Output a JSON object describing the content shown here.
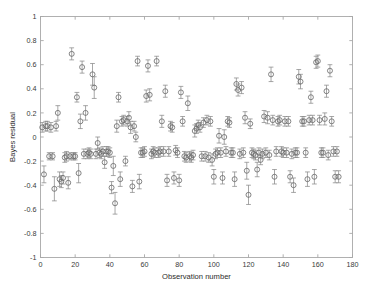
{
  "chart_data": {
    "type": "scatter",
    "title": "",
    "xlabel": "Observation number",
    "ylabel": "Bayes residual",
    "xlim": [
      0,
      180
    ],
    "ylim": [
      -1,
      1
    ],
    "xticks": [
      0,
      20,
      40,
      60,
      80,
      100,
      120,
      140,
      160,
      180
    ],
    "xticklabels": [
      "0",
      "20",
      "40",
      "60",
      "80",
      "100",
      "120",
      "140",
      "160",
      "180"
    ],
    "yticks": [
      -1,
      -0.8,
      -0.6,
      -0.4,
      -0.2,
      0,
      0.2,
      0.4,
      0.6,
      0.8,
      1
    ],
    "yticklabels": [
      "-1",
      "-0.8",
      "-0.6",
      "-0.4",
      "-0.2",
      "0",
      "0.2",
      "0.4",
      "0.6",
      "0.8",
      "1"
    ],
    "grid": false,
    "legend": null,
    "marker": "open-circle",
    "errorbars": true,
    "series": [
      {
        "name": "Bayes residual",
        "x": [
          1,
          2,
          3,
          4,
          5,
          6,
          7,
          8,
          9,
          10,
          11,
          12,
          13,
          14,
          15,
          16,
          17,
          18,
          19,
          20,
          21,
          22,
          23,
          24,
          25,
          26,
          27,
          28,
          29,
          30,
          31,
          32,
          33,
          34,
          35,
          36,
          37,
          38,
          39,
          40,
          41,
          42,
          43,
          44,
          45,
          46,
          47,
          48,
          49,
          50,
          51,
          52,
          53,
          54,
          55,
          56,
          57,
          58,
          59,
          60,
          61,
          62,
          63,
          64,
          65,
          66,
          67,
          68,
          69,
          70,
          71,
          72,
          73,
          74,
          75,
          76,
          77,
          78,
          79,
          80,
          81,
          82,
          83,
          84,
          85,
          86,
          87,
          88,
          89,
          90,
          91,
          92,
          93,
          94,
          95,
          96,
          97,
          98,
          99,
          100,
          101,
          102,
          103,
          104,
          105,
          106,
          107,
          108,
          109,
          110,
          111,
          112,
          113,
          114,
          115,
          116,
          117,
          118,
          119,
          120,
          121,
          122,
          123,
          124,
          125,
          126,
          127,
          128,
          129,
          130,
          131,
          132,
          133,
          134,
          135,
          136,
          137,
          138,
          139,
          140,
          141,
          142,
          143,
          144,
          145,
          146,
          147,
          148,
          149,
          150,
          151,
          152,
          153,
          154,
          155,
          156,
          157,
          158,
          159,
          160,
          161,
          162,
          163,
          164,
          165,
          166,
          167,
          168,
          169,
          170,
          171,
          172
        ],
        "y": [
          0.08,
          -0.31,
          0.09,
          0.09,
          -0.16,
          0.08,
          -0.16,
          -0.43,
          0.09,
          0.2,
          -0.35,
          -0.37,
          -0.34,
          -0.17,
          -0.16,
          -0.38,
          -0.16,
          0.69,
          -0.16,
          -0.16,
          0.33,
          -0.3,
          0.13,
          0.58,
          -0.14,
          0.2,
          -0.14,
          -0.13,
          -0.14,
          0.52,
          0.41,
          -0.14,
          -0.05,
          -0.13,
          -0.14,
          -0.12,
          -0.21,
          -0.12,
          -0.12,
          -0.13,
          -0.42,
          -0.24,
          -0.55,
          0.09,
          0.33,
          -0.35,
          0.13,
          0.14,
          -0.2,
          0.13,
          0.16,
          0.08,
          -0.41,
          0.09,
          0.0,
          0.63,
          -0.37,
          -0.13,
          -0.13,
          -0.12,
          0.34,
          0.59,
          0.35,
          -0.14,
          -0.12,
          -0.13,
          0.63,
          -0.13,
          -0.12,
          0.13,
          -0.12,
          0.38,
          -0.36,
          -0.12,
          0.09,
          0.08,
          -0.34,
          -0.11,
          -0.13,
          -0.36,
          0.37,
          0.13,
          -0.16,
          -0.17,
          0.28,
          -0.16,
          -0.17,
          -0.15,
          0.05,
          0.07,
          0.1,
          0.08,
          -0.16,
          0.12,
          -0.16,
          0.14,
          -0.17,
          0.13,
          -0.19,
          -0.33,
          -0.14,
          -0.13,
          0.01,
          -0.13,
          -0.34,
          0.0,
          -0.12,
          0.13,
          0.12,
          -0.13,
          -0.13,
          -0.35,
          0.44,
          0.39,
          -0.14,
          0.41,
          -0.13,
          0.16,
          -0.28,
          -0.48,
          0.11,
          -0.13,
          -0.14,
          -0.15,
          -0.27,
          -0.13,
          -0.19,
          -0.14,
          0.17,
          -0.13,
          0.16,
          -0.15,
          0.52,
          0.14,
          -0.33,
          -0.12,
          0.13,
          0.14,
          -0.12,
          -0.13,
          0.13,
          -0.13,
          0.13,
          -0.33,
          -0.14,
          -0.4,
          -0.13,
          -0.13,
          0.5,
          0.46,
          0.13,
          0.13,
          -0.13,
          -0.35,
          0.14,
          0.33,
          0.14,
          -0.33,
          0.62,
          0.63,
          0.14,
          -0.13,
          -0.13,
          0.15,
          0.38,
          -0.15,
          0.55,
          0.13,
          -0.12,
          -0.33,
          -0.12,
          -0.33
        ],
        "yerr": [
          0.04,
          0.07,
          0.04,
          0.04,
          0.03,
          0.04,
          0.03,
          0.1,
          0.04,
          0.06,
          0.06,
          0.05,
          0.05,
          0.04,
          0.04,
          0.05,
          0.03,
          0.05,
          0.03,
          0.03,
          0.04,
          0.08,
          0.06,
          0.05,
          0.04,
          0.06,
          0.04,
          0.04,
          0.04,
          0.09,
          0.09,
          0.04,
          0.05,
          0.04,
          0.04,
          0.04,
          0.05,
          0.04,
          0.04,
          0.04,
          0.05,
          0.08,
          0.09,
          0.05,
          0.04,
          0.06,
          0.04,
          0.04,
          0.04,
          0.04,
          0.05,
          0.05,
          0.05,
          0.04,
          0.04,
          0.04,
          0.06,
          0.04,
          0.04,
          0.04,
          0.05,
          0.05,
          0.05,
          0.04,
          0.04,
          0.04,
          0.04,
          0.04,
          0.04,
          0.05,
          0.04,
          0.05,
          0.05,
          0.04,
          0.04,
          0.04,
          0.05,
          0.04,
          0.04,
          0.05,
          0.05,
          0.04,
          0.04,
          0.04,
          0.06,
          0.04,
          0.04,
          0.04,
          0.05,
          0.04,
          0.04,
          0.04,
          0.04,
          0.04,
          0.04,
          0.04,
          0.04,
          0.04,
          0.05,
          0.06,
          0.04,
          0.04,
          0.06,
          0.04,
          0.05,
          0.06,
          0.04,
          0.04,
          0.04,
          0.04,
          0.04,
          0.06,
          0.05,
          0.05,
          0.04,
          0.05,
          0.04,
          0.05,
          0.07,
          0.08,
          0.04,
          0.04,
          0.04,
          0.04,
          0.06,
          0.04,
          0.04,
          0.04,
          0.05,
          0.04,
          0.05,
          0.04,
          0.06,
          0.04,
          0.06,
          0.04,
          0.04,
          0.04,
          0.04,
          0.04,
          0.04,
          0.04,
          0.04,
          0.05,
          0.04,
          0.06,
          0.04,
          0.04,
          0.06,
          0.06,
          0.04,
          0.04,
          0.04,
          0.06,
          0.04,
          0.05,
          0.04,
          0.06,
          0.05,
          0.05,
          0.04,
          0.04,
          0.04,
          0.05,
          0.05,
          0.04,
          0.05,
          0.04,
          0.04,
          0.05,
          0.04,
          0.05
        ]
      }
    ],
    "colors": {
      "axis": "#a8a8a8",
      "marker": "#666666",
      "errorbar": "#8a8a8a",
      "text": "#2b2b2b",
      "background": "#ffffff"
    }
  }
}
